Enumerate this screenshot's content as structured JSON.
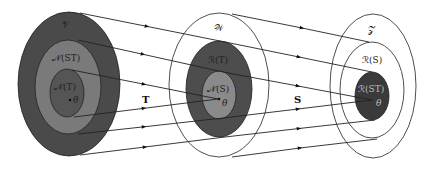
{
  "colors": {
    "background": "#ffffff",
    "outer_V_fill": "#4a4a4a",
    "middle_V_fill": "#7a7a7a",
    "inner_V_fill": "#555555",
    "outer_W_fill": "#ffffff",
    "middle_W_fill": "#4d4d4d",
    "inner_W_fill": "#8a8a8a",
    "outer_Z_fill": "#ffffff",
    "middle_Z_fill": "#ffffff",
    "inner_Z_fill": "#3a3a3a",
    "stroke": "#222222"
  },
  "sets": {
    "V": {
      "outer_label": "𝒱",
      "middle_label": "𝒩(ST)",
      "inner_label": "𝒩(T)",
      "point_label": "θ"
    },
    "W": {
      "outer_label": "𝒲",
      "middle_label": "ℛ(T)",
      "inner_label": "𝒩(S)",
      "point_label": "θ"
    },
    "Z": {
      "outer_label": "𝒵",
      "middle_label": "ℛ(S)",
      "inner_label": "ℛ(ST)",
      "point_label": "θ"
    }
  },
  "operators": {
    "first": "T",
    "second": "S"
  },
  "mappings": {
    "T": [
      {
        "from": [
          80,
          13
        ],
        "to": [
          225,
          42
        ]
      },
      {
        "from": [
          78,
          40
        ],
        "to": [
          223,
          72
        ]
      },
      {
        "from": [
          72,
          70
        ],
        "to": [
          218,
          99
        ]
      },
      {
        "from": [
          74,
          117
        ],
        "to": [
          218,
          99
        ]
      },
      {
        "from": [
          78,
          134
        ],
        "to": [
          223,
          118
        ]
      },
      {
        "from": [
          80,
          155
        ],
        "to": [
          225,
          137
        ]
      }
    ],
    "S": [
      {
        "from": [
          232,
          14
        ],
        "to": [
          369,
          42
        ]
      },
      {
        "from": [
          225,
          42
        ],
        "to": [
          372,
          72
        ]
      },
      {
        "from": [
          223,
          72
        ],
        "to": [
          372,
          100
        ]
      },
      {
        "from": [
          223,
          118
        ],
        "to": [
          372,
          100
        ]
      },
      {
        "from": [
          225,
          137
        ],
        "to": [
          375,
          120
        ]
      },
      {
        "from": [
          232,
          157
        ],
        "to": [
          377,
          139
        ]
      }
    ]
  }
}
